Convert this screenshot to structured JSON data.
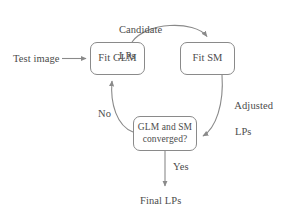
{
  "figure": {
    "type": "flowchart",
    "stroke_color": "#8a8a8a",
    "text_color": "#4c4c4c",
    "background_color": "#ffffff"
  },
  "nodes": {
    "fit_glm": {
      "label": "Fit GLM",
      "shape": "rounded-rect"
    },
    "fit_sm": {
      "label": "Fit SM",
      "shape": "rounded-rect"
    },
    "converged": {
      "line1": "GLM and SM",
      "line2": "converged?",
      "shape": "rounded-rect"
    }
  },
  "labels": {
    "test_image": "Test image",
    "candidate_lps_line1": "Candidate",
    "candidate_lps_line2": "LPs",
    "adjusted_lps_line1": "Adjusted",
    "adjusted_lps_line2": "LPs",
    "no": "No",
    "yes": "Yes",
    "final_lps": "Final LPs"
  },
  "edges": [
    {
      "from": "test_image",
      "to": "fit_glm",
      "label": "",
      "style": "straight-arrow"
    },
    {
      "from": "fit_glm",
      "to": "fit_sm",
      "label": "Candidate LPs",
      "style": "curved-arrow"
    },
    {
      "from": "fit_sm",
      "to": "converged",
      "label": "Adjusted LPs",
      "style": "curved-arrow"
    },
    {
      "from": "converged",
      "to": "fit_glm",
      "label": "No",
      "style": "curved-arrow"
    },
    {
      "from": "converged",
      "to": "final_lps",
      "label": "Yes",
      "style": "straight-arrow"
    }
  ]
}
